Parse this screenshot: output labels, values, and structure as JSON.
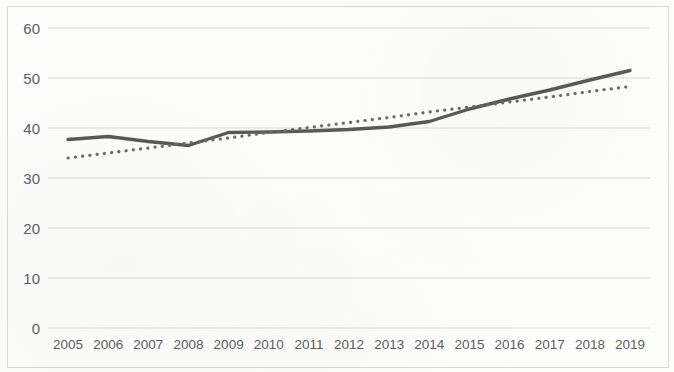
{
  "chart_data": {
    "type": "line",
    "title": "",
    "subtitle": "",
    "xlabel": "",
    "ylabel": "",
    "categories": [
      "2005",
      "2006",
      "2007",
      "2008",
      "2009",
      "2010",
      "2011",
      "2012",
      "2013",
      "2014",
      "2015",
      "2016",
      "2017",
      "2018",
      "2019"
    ],
    "ylim": [
      0,
      60
    ],
    "yticks": [
      0,
      10,
      20,
      30,
      40,
      50,
      60
    ],
    "ytick_labels": [
      "0",
      "10",
      "20",
      "30",
      "40",
      "50",
      "60"
    ],
    "grid": true,
    "grid_axis": "y",
    "legend": "none",
    "series": [
      {
        "name": "data-series",
        "style": "solid",
        "color": "#595959",
        "values": [
          37.7,
          38.3,
          37.3,
          36.5,
          39.1,
          39.2,
          39.4,
          39.7,
          40.2,
          41.3,
          43.8,
          45.8,
          47.6,
          49.6,
          51.5
        ]
      },
      {
        "name": "linear-trendline",
        "style": "dotted",
        "color": "#6b6b6b",
        "values": [
          34.0,
          35.0,
          36.0,
          37.0,
          38.0,
          39.1,
          40.1,
          41.1,
          42.1,
          43.2,
          44.2,
          45.2,
          46.2,
          47.3,
          48.3
        ]
      }
    ]
  },
  "axes": {
    "y_tick_labels": [
      "60",
      "50",
      "40",
      "30",
      "20",
      "10",
      "0"
    ],
    "x_tick_labels": [
      "2005",
      "2006",
      "2007",
      "2008",
      "2009",
      "2010",
      "2011",
      "2012",
      "2013",
      "2014",
      "2015",
      "2016",
      "2017",
      "2018",
      "2019"
    ]
  },
  "colors": {
    "series_line": "#595959",
    "trendline": "#6b6b6b",
    "gridline": "#d9d9d9",
    "axis_text": "#5d5d5d",
    "frame": "#d7d7d7",
    "background": "#fdfdfc"
  }
}
